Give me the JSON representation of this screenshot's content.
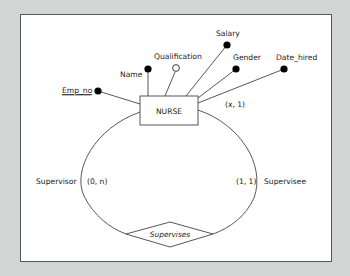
{
  "diagram": {
    "type": "ER diagram (unary/recursive relationship)",
    "entity": {
      "name": "NURSE"
    },
    "attributes": [
      {
        "name": "Emp_no",
        "key": true,
        "optional": false
      },
      {
        "name": "Name",
        "key": false,
        "optional": false
      },
      {
        "name": "Qualification",
        "key": false,
        "optional": true
      },
      {
        "name": "Salary",
        "key": false,
        "optional": false
      },
      {
        "name": "Gender",
        "key": false,
        "optional": false
      },
      {
        "name": "Date_hired",
        "key": false,
        "optional": false
      }
    ],
    "entity_cardinality": "(x, 1)",
    "relationship": {
      "name": "Supervises",
      "roles": [
        {
          "role": "Supervisor",
          "cardinality": "(0, n)"
        },
        {
          "role": "Supervisee",
          "cardinality": "(1, 1)"
        }
      ]
    },
    "colors": {
      "background": "#d3d5d4",
      "canvas": "#ffffff",
      "line": "#444444",
      "dot": "#000000"
    }
  }
}
